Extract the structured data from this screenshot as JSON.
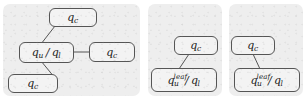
{
  "figure": {
    "type": "diagram",
    "background_color": "#ffffff",
    "panel_fill": "#eeeeee",
    "node_fill": "#f3f3f3",
    "node_stroke": "#555555",
    "edge_stroke": "#555555"
  },
  "panels": [
    {
      "id": "panel-1",
      "nodes": [
        {
          "id": "p1-top",
          "label": "q_c",
          "base": "q",
          "sub": "c",
          "sup": "",
          "second_base": "",
          "second_sub": "",
          "has_slash": false
        },
        {
          "id": "p1-center",
          "label": "q_u / q_l",
          "base": "q",
          "sub": "u",
          "sup": "",
          "second_base": "q",
          "second_sub": "l",
          "has_slash": true
        },
        {
          "id": "p1-right",
          "label": "q_c",
          "base": "q",
          "sub": "c",
          "sup": "",
          "second_base": "",
          "second_sub": "",
          "has_slash": false
        },
        {
          "id": "p1-bottom",
          "label": "q_c",
          "base": "q",
          "sub": "c",
          "sup": "",
          "second_base": "",
          "second_sub": "",
          "has_slash": false
        }
      ],
      "edges": [
        {
          "from": "p1-center",
          "to": "p1-top"
        },
        {
          "from": "p1-center",
          "to": "p1-right"
        },
        {
          "from": "p1-center",
          "to": "p1-bottom"
        }
      ]
    },
    {
      "id": "panel-2",
      "nodes": [
        {
          "id": "p2-top",
          "label": "q_c",
          "base": "q",
          "sub": "c",
          "sup": "",
          "second_base": "",
          "second_sub": "",
          "has_slash": false
        },
        {
          "id": "p2-bottom",
          "label": "q_u^leaf / q_l",
          "base": "q",
          "sub": "u",
          "sup": "leaf",
          "second_base": "q",
          "second_sub": "l",
          "has_slash": true
        }
      ],
      "edges": [
        {
          "from": "p2-bottom",
          "to": "p2-top"
        }
      ]
    },
    {
      "id": "panel-3",
      "nodes": [
        {
          "id": "p3-top",
          "label": "q_c",
          "base": "q",
          "sub": "c",
          "sup": "",
          "second_base": "",
          "second_sub": "",
          "has_slash": false
        },
        {
          "id": "p3-bottom",
          "label": "q_u^leaf / q_l",
          "base": "q",
          "sub": "u",
          "sup": "leaf",
          "second_base": "q",
          "second_sub": "l",
          "has_slash": true
        }
      ],
      "edges": [
        {
          "from": "p3-bottom",
          "to": "p3-top"
        }
      ]
    }
  ],
  "symbols": {
    "slash": "/"
  }
}
